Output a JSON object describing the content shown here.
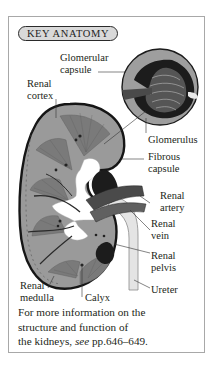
{
  "panel": {
    "title": "KEY ANATOMY",
    "labels": {
      "glomerular_capsule_1": "Glomerular",
      "glomerular_capsule_2": "capsule",
      "renal_cortex_1": "Renal",
      "renal_cortex_2": "cortex",
      "glomerulus": "Glomerulus",
      "fibrous_capsule_1": "Fibrous",
      "fibrous_capsule_2": "capsule",
      "renal_artery_1": "Renal",
      "renal_artery_2": "artery",
      "renal_vein_1": "Renal",
      "renal_vein_2": "vein",
      "renal_pelvis_1": "Renal",
      "renal_pelvis_2": "pelvis",
      "ureter": "Ureter",
      "renal_medulla_1": "Renal",
      "renal_medulla_2": "medulla",
      "calyx": "Calyx"
    },
    "caption": {
      "line1": "For more information on the",
      "line2": "structure and function of",
      "line3_prefix": "the kidneys, ",
      "line3_see": "see",
      "line3_pages": " pp.646–649."
    }
  },
  "colors": {
    "cortex": "#8f8f8f",
    "medulla": "#6f6f6f",
    "outline": "#1a1a1a",
    "ureter": "#e2e2e2",
    "frame": "#a8a8a8",
    "pill": "#d9d9d9"
  }
}
